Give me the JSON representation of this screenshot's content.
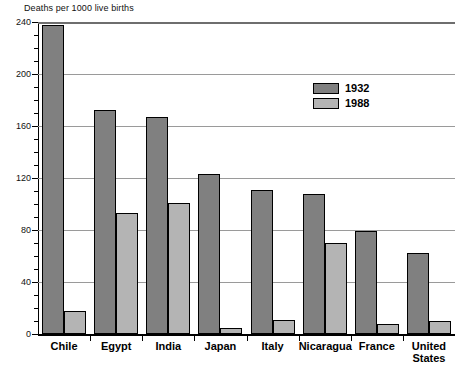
{
  "chart_data": {
    "type": "bar",
    "title": "Deaths per 1000 live births",
    "xlabel": "",
    "ylabel": "",
    "ylim": [
      0,
      240
    ],
    "yticks": [
      0,
      40,
      80,
      120,
      160,
      200,
      240
    ],
    "ytick_labels": [
      "0",
      "40",
      "80",
      "120",
      "160",
      "200",
      "240"
    ],
    "minor_tick_interval": 10,
    "grid": true,
    "legend_position": "upper right",
    "categories": [
      "Chile",
      "Egypt",
      "India",
      "Japan",
      "Italy",
      "Nicaragua",
      "France",
      "United States"
    ],
    "series": [
      {
        "name": "1932",
        "color": "#808080",
        "values": [
          238,
          172,
          167,
          123,
          111,
          108,
          79,
          62
        ]
      },
      {
        "name": "1988",
        "color": "#b4b4b4",
        "values": [
          18,
          93,
          101,
          5,
          11,
          70,
          8,
          10
        ]
      }
    ]
  },
  "legend": {
    "items": [
      {
        "label": "1932"
      },
      {
        "label": "1988"
      }
    ]
  }
}
